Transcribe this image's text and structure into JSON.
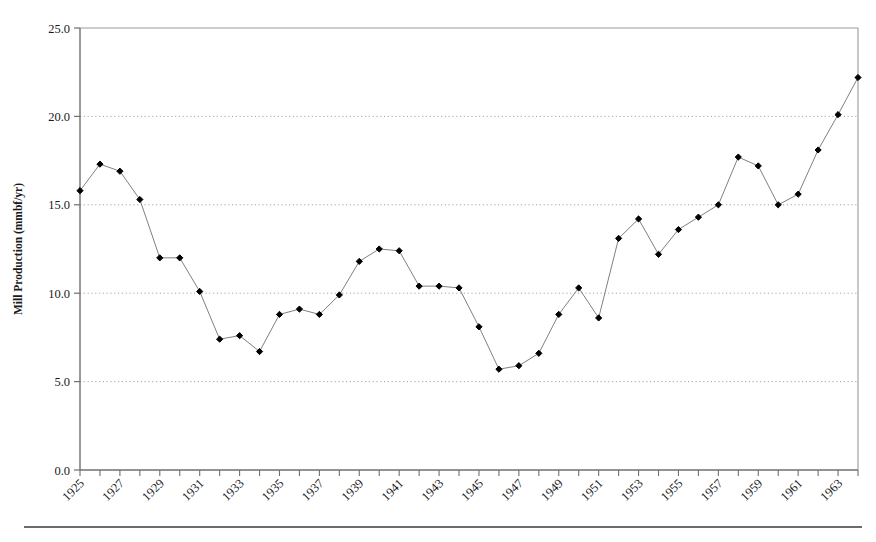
{
  "chart_data": {
    "type": "line",
    "title": "",
    "subtitle": "",
    "xlabel": "",
    "ylabel": "Mill Production (mmbf/yr)",
    "xlim": [
      1925,
      1964
    ],
    "ylim": [
      0.0,
      25.0
    ],
    "grid": "horizontal-dotted",
    "legend": "none",
    "marker": "filled-diamond",
    "line_color": "#808080",
    "marker_color": "#000000",
    "y_ticks": [
      "0.0",
      "5.0",
      "10.0",
      "15.0",
      "20.0",
      "25.0"
    ],
    "y_tick_values": [
      0.0,
      5.0,
      10.0,
      15.0,
      20.0,
      25.0
    ],
    "x_tick_labels": [
      "1925",
      "1927",
      "1929",
      "1931",
      "1933",
      "1935",
      "1937",
      "1939",
      "1941",
      "1943",
      "1945",
      "1947",
      "1949",
      "1951",
      "1953",
      "1955",
      "1957",
      "1959",
      "1961",
      "1963"
    ],
    "x_tick_label_values": [
      1925,
      1927,
      1929,
      1931,
      1933,
      1935,
      1937,
      1939,
      1941,
      1943,
      1945,
      1947,
      1949,
      1951,
      1953,
      1955,
      1957,
      1959,
      1961,
      1963
    ],
    "x_minor_tick_values": [
      1925,
      1926,
      1927,
      1928,
      1929,
      1930,
      1931,
      1932,
      1933,
      1934,
      1935,
      1936,
      1937,
      1938,
      1939,
      1940,
      1941,
      1942,
      1943,
      1944,
      1945,
      1946,
      1947,
      1948,
      1949,
      1950,
      1951,
      1952,
      1953,
      1954,
      1955,
      1956,
      1957,
      1958,
      1959,
      1960,
      1961,
      1962,
      1963,
      1964
    ],
    "x": [
      1925,
      1926,
      1927,
      1928,
      1929,
      1930,
      1931,
      1932,
      1933,
      1934,
      1935,
      1936,
      1937,
      1938,
      1939,
      1940,
      1941,
      1942,
      1943,
      1944,
      1945,
      1946,
      1947,
      1948,
      1949,
      1950,
      1951,
      1952,
      1953,
      1954,
      1955,
      1956,
      1957,
      1958,
      1959,
      1960,
      1961,
      1962,
      1963,
      1964
    ],
    "values": [
      15.8,
      17.3,
      16.9,
      15.3,
      12.0,
      12.0,
      10.1,
      7.4,
      7.6,
      6.7,
      8.8,
      9.1,
      8.8,
      9.9,
      11.8,
      12.5,
      12.4,
      10.4,
      10.4,
      10.3,
      8.1,
      5.7,
      5.9,
      6.6,
      8.8,
      10.3,
      8.6,
      13.1,
      14.2,
      12.2,
      13.6,
      14.3,
      15.0,
      17.7,
      17.2,
      15.0,
      15.6,
      18.1,
      20.1,
      22.2
    ],
    "series": [
      {
        "name": "Mill Production",
        "values": [
          15.8,
          17.3,
          16.9,
          15.3,
          12.0,
          12.0,
          10.1,
          7.4,
          7.6,
          6.7,
          8.8,
          9.1,
          8.8,
          9.9,
          11.8,
          12.5,
          12.4,
          10.4,
          10.4,
          10.3,
          8.1,
          5.7,
          5.9,
          6.6,
          8.8,
          10.3,
          8.6,
          13.1,
          14.2,
          12.2,
          13.6,
          14.3,
          15.0,
          17.7,
          17.2,
          15.0,
          15.6,
          18.1,
          20.1,
          22.2
        ]
      }
    ]
  },
  "figure": {
    "footer_rule": true
  }
}
